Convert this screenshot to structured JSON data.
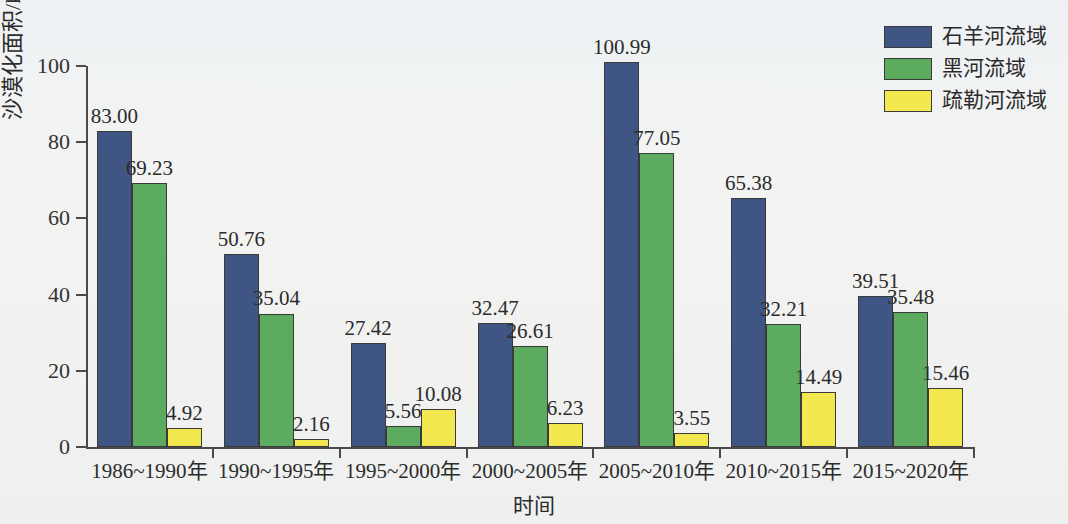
{
  "chart_data": {
    "type": "bar",
    "title": "",
    "xlabel": "时间",
    "ylabel": "沙漠化面积/km²",
    "ylabel_base": "沙漠化面积/km",
    "ylabel_sup": "2",
    "ylim": [
      0,
      100
    ],
    "yticks": [
      0,
      20,
      40,
      60,
      80,
      100
    ],
    "ytick_labels": [
      "0",
      "20",
      "40",
      "60",
      "80",
      "100"
    ],
    "grid": false,
    "legend_position": "top-right",
    "categories": [
      "1986~1990年",
      "1990~1995年",
      "1995~2000年",
      "2000~2005年",
      "2005~2010年",
      "2010~2015年",
      "2015~2020年"
    ],
    "series": [
      {
        "name": "石羊河流域",
        "color": "#3f5684",
        "values": [
          83.0,
          50.76,
          27.42,
          32.47,
          100.99,
          65.38,
          39.51
        ],
        "labels": [
          "83.00",
          "50.76",
          "27.42",
          "32.47",
          "100.99",
          "65.38",
          "39.51"
        ]
      },
      {
        "name": "黑河流域",
        "color": "#5cab5e",
        "values": [
          69.23,
          35.04,
          5.56,
          26.61,
          77.05,
          32.21,
          35.48
        ],
        "labels": [
          "69.23",
          "35.04",
          "5.56",
          "26.61",
          "77.05",
          "32.21",
          "35.48"
        ]
      },
      {
        "name": "疏勒河流域",
        "color": "#f3e84f",
        "values": [
          4.92,
          2.16,
          10.08,
          6.23,
          3.55,
          14.49,
          15.46
        ],
        "labels": [
          "4.92",
          "2.16",
          "10.08",
          "6.23",
          "3.55",
          "14.49",
          "15.46"
        ]
      }
    ]
  },
  "legend": {
    "items": [
      {
        "label": "石羊河流域",
        "color": "#3f5684"
      },
      {
        "label": "黑河流域",
        "color": "#5cab5e"
      },
      {
        "label": "疏勒河流域",
        "color": "#f3e84f"
      }
    ]
  },
  "axes": {
    "x_title": "时间",
    "y_title_base": "沙漠化面积/km",
    "y_title_sup": "2"
  }
}
